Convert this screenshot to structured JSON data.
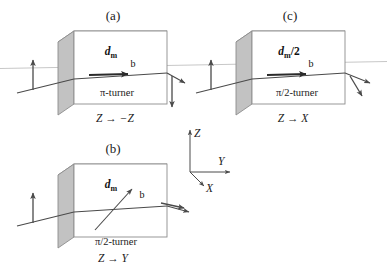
{
  "figure": {
    "background_color": "#ffffff",
    "width": 387,
    "height": 266
  },
  "panels": [
    {
      "id": "a",
      "caption": "(a)",
      "thickness_label_main": "d",
      "thickness_label_sub": "m",
      "thickness_label_suffix": "",
      "field_label": "b",
      "turner_label": "π-turner",
      "transform_label": "Z → −Z",
      "input_polarization": "up",
      "output_polarization": "down"
    },
    {
      "id": "b",
      "caption": "(b)",
      "thickness_label_main": "d",
      "thickness_label_sub": "m",
      "thickness_label_suffix": "",
      "field_label": "b",
      "turner_label": "π/2-turner",
      "transform_label": "Z → Y",
      "input_polarization": "up",
      "output_polarization": "along-Y"
    },
    {
      "id": "c",
      "caption": "(c)",
      "thickness_label_main": "d",
      "thickness_label_sub": "m",
      "thickness_label_suffix": "/2",
      "field_label": "b",
      "turner_label": "π/2-turner",
      "transform_label": "Z → X",
      "input_polarization": "up",
      "output_polarization": "along-X"
    }
  ],
  "axes": {
    "z_label": "Z",
    "y_label": "Y",
    "x_label": "X"
  },
  "colors": {
    "box_front": "#ffffff",
    "box_top": "#d2d2d2",
    "box_side": "#c2c2c2",
    "box_edge": "#8d8d8d",
    "ray": "#4a4a4a",
    "ray_faint": "#b9b9b9",
    "text": "#1a1a1a"
  }
}
